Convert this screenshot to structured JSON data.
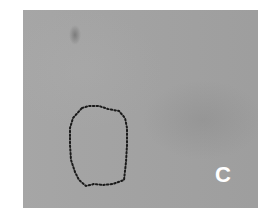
{
  "figure": {
    "panel_label": "C",
    "background_color": "#a3a3a3",
    "outline": {
      "style": "dotted",
      "color": "#1a1a1a",
      "points": "59,98 66,96 76,96 85,99 96,101 102,108 104,118 104,135 103,152 101,170 90,174 80,175 71,174 63,176 56,170 52,162 48,150 47,135 47,118 50,108"
    }
  }
}
